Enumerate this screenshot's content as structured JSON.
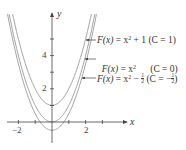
{
  "chart_data": {
    "type": "line",
    "title": "",
    "xlabel": "x",
    "ylabel": "y",
    "xlim": [
      -2.5,
      4.4
    ],
    "ylim": [
      -1.3,
      6.5
    ],
    "x_ticks": [
      -2,
      -1,
      1,
      2,
      3
    ],
    "x_tick_labels": [
      "-2",
      "2"
    ],
    "y_ticks": [
      1,
      2,
      3,
      4,
      5
    ],
    "y_tick_labels": [
      "2",
      "4"
    ],
    "grid": false,
    "legend_position": "annotations-right",
    "series": [
      {
        "name": "F(x) = x^2 + 1 (C = 1)",
        "formula": "x^2 + 1",
        "C": 1,
        "color": "#9a9a9a"
      },
      {
        "name": "F(x) = x^2 (C = 0)",
        "formula": "x^2",
        "C": 0,
        "color": "#9a9a9a"
      },
      {
        "name": "F(x) = x^2 - 1/2 (C = -1/2)",
        "formula": "x^2 - 1/2",
        "C": -0.5,
        "color": "#9a9a9a"
      }
    ],
    "annotations": [
      {
        "text": "F(x) = x² + 1 (C = 1)",
        "points_to_y": 4.9
      },
      {
        "text": "F(x) = x² (C = 0)",
        "points_to_y": 3.5
      },
      {
        "text": "F(x) = x² − ½ (C = −½)",
        "points_to_y": 2.0
      }
    ]
  },
  "labels": {
    "x_axis": "x",
    "y_axis": "y",
    "tick_neg2": "−2",
    "tick_2": "2",
    "tick_y2": "2",
    "tick_y4": "4",
    "ann1": {
      "lhs": "F(x)",
      "eq": " = x",
      "exp": "2",
      "rest": " + 1 (C = 1)"
    },
    "ann2": {
      "lhs": "F(x)",
      "eq": " = x",
      "exp": "2",
      "rest": "      (C = 0)"
    },
    "ann3": {
      "lhs": "F(x)",
      "eq": " = x",
      "exp": "2",
      "minus": " − ",
      "fnum": "1",
      "fden": "2",
      "c_open": " (C = −",
      "c_close": ")"
    }
  },
  "colors": {
    "curve": "#9a9a9a",
    "axis": "#444444",
    "text": "#333333"
  }
}
